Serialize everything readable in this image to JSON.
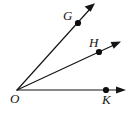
{
  "figure": {
    "background_color": "#ffffff",
    "stroke_color": "#141414",
    "width": 128,
    "height": 114,
    "vertex": {
      "name": "O",
      "label": "O",
      "x": 17,
      "y": 90,
      "label_x": 10,
      "label_y": 103,
      "has_dot": false
    },
    "rays": [
      {
        "id": "ray-OG",
        "label": "G",
        "point_label": "G",
        "from": "O",
        "through": "G",
        "start_x": 17,
        "start_y": 90,
        "point_x": 78,
        "point_y": 23,
        "tip_x": 95,
        "tip_y": 4,
        "label_x": 63,
        "label_y": 20,
        "arrow_direction": "up-right"
      },
      {
        "id": "ray-OH",
        "label": "H",
        "point_label": "H",
        "from": "O",
        "through": "H",
        "start_x": 17,
        "start_y": 90,
        "point_x": 99,
        "point_y": 52,
        "tip_x": 120,
        "tip_y": 42,
        "label_x": 89,
        "label_y": 47,
        "arrow_direction": "right-up"
      },
      {
        "id": "ray-OK",
        "label": "K",
        "point_label": "K",
        "from": "O",
        "through": "K",
        "start_x": 17,
        "start_y": 90,
        "point_x": 106,
        "point_y": 90,
        "tip_x": 126,
        "tip_y": 90,
        "label_x": 102,
        "label_y": 104,
        "arrow_direction": "right"
      }
    ]
  }
}
